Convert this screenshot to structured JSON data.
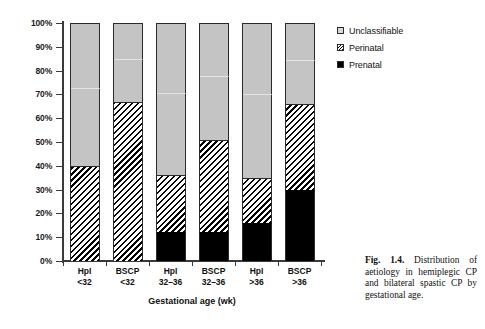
{
  "chart_data": {
    "type": "bar",
    "stacked": true,
    "title": "",
    "xlabel": "Gestational age (wk)",
    "ylabel": "",
    "ylim": [
      0,
      100
    ],
    "ytick_labels": [
      "0%",
      "10%",
      "20%",
      "30%",
      "40%",
      "50%",
      "60%",
      "70%",
      "80%",
      "90%",
      "100%"
    ],
    "ytick_values": [
      0,
      10,
      20,
      30,
      40,
      50,
      60,
      70,
      80,
      90,
      100
    ],
    "grid": false,
    "legend_position": "right-top",
    "categories": [
      "HpI <32",
      "BSCP <32",
      "HpI 32-36",
      "BSCP 32-36",
      "HpI >36",
      "BSCP >36"
    ],
    "category_lines": [
      [
        "HpI",
        "<32"
      ],
      [
        "BSCP",
        "<32"
      ],
      [
        "HpI",
        "32–36"
      ],
      [
        "BSCP",
        "32–36"
      ],
      [
        "HpI",
        ">36"
      ],
      [
        "BSCP",
        ">36"
      ]
    ],
    "series": [
      {
        "name": "Prenatal",
        "color": "#000000",
        "values": [
          0,
          0,
          12,
          12,
          16,
          30
        ]
      },
      {
        "name": "Perinatal",
        "color": "#hatch",
        "values": [
          40,
          67,
          24,
          39,
          19,
          36
        ]
      },
      {
        "name": "Unclassifiable",
        "color": "#c4c4c4",
        "values": [
          60,
          33,
          64,
          49,
          65,
          34
        ]
      }
    ],
    "cumulative_tops": {
      "prenatal": [
        0,
        0,
        12,
        12,
        16,
        30
      ],
      "perinatal": [
        40,
        67,
        36,
        51,
        35,
        66
      ],
      "total": [
        100,
        100,
        100,
        100,
        100,
        100
      ]
    }
  },
  "legend": {
    "items": [
      {
        "label": "Unclassifiable",
        "swatch": "unclassifiable-swatch"
      },
      {
        "label": "Perinatal",
        "swatch": "perinatal-swatch"
      },
      {
        "label": "Prenatal",
        "swatch": "prenatal-swatch"
      }
    ]
  },
  "axis": {
    "x_title": "Gestational age (wk)"
  },
  "caption": {
    "figure_number": "Fig. 1.4.",
    "text": " Distribution of aetiology in hemiplegic CP and bilateral spastic CP by gestational age."
  }
}
